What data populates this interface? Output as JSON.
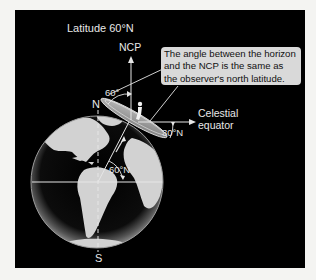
{
  "title": "Latitude 60°N",
  "labels": {
    "ncp": "NCP",
    "north": "N",
    "south": "S",
    "angle_horizon": "60°",
    "angle_latitude": "60°N",
    "angle_equator": "30°N",
    "celestial_equator_line1": "Celestial",
    "celestial_equator_line2": "equator"
  },
  "callout": {
    "line1": "The angle between the horizon",
    "line2": "and the NCP is the same as",
    "line3": "the observer's north latitude."
  },
  "colors": {
    "background": "#000000",
    "callout_fill": "#d9d9d9",
    "land": "#d4d4d4",
    "ocean": "#1a1a1a",
    "line": "#e6e6e6"
  }
}
